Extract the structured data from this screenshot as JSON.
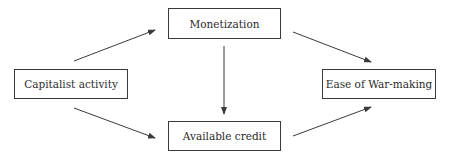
{
  "diagram": {
    "type": "flowchart",
    "nodes": [
      {
        "id": "capitalist",
        "label": "Capitalist activity"
      },
      {
        "id": "monetization",
        "label": "Monetization"
      },
      {
        "id": "credit",
        "label": "Available credit"
      },
      {
        "id": "war",
        "label": "Ease of War-making"
      }
    ],
    "edges": [
      {
        "from": "Capitalist activity",
        "to": "Monetization"
      },
      {
        "from": "Capitalist activity",
        "to": "Available credit"
      },
      {
        "from": "Monetization",
        "to": "Available credit"
      },
      {
        "from": "Monetization",
        "to": "Ease of War-making"
      },
      {
        "from": "Available credit",
        "to": "Ease of War-making"
      }
    ],
    "colors": {
      "border": "#3a3a3a",
      "text": "#2b2b2b",
      "background": "#ffffff"
    }
  }
}
